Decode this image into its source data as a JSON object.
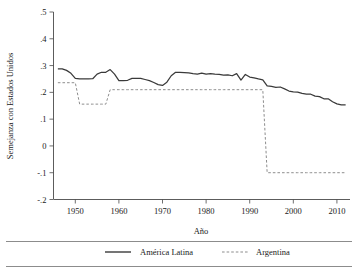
{
  "chart_data": {
    "type": "line",
    "title": "",
    "xlabel": "Año",
    "ylabel": "Semejanza con Estados Unidos",
    "xlim": [
      1945,
      2013
    ],
    "ylim": [
      -0.2,
      0.5
    ],
    "grid": false,
    "legend_position": "bottom",
    "xticks": [
      1950,
      1960,
      1970,
      1980,
      1990,
      2000,
      2010
    ],
    "xtick_labels": [
      "1950",
      "1960",
      "1970",
      "1980",
      "1990",
      "2000",
      "2010"
    ],
    "yticks": [
      0.5,
      0.4,
      0.3,
      0.2,
      0.1,
      0.0,
      -0.1,
      -0.2
    ],
    "ytick_labels": [
      ".5",
      ".4",
      ".3",
      ".2",
      ".1",
      "0",
      "-.1",
      "-.2"
    ],
    "series": [
      {
        "name": "América Latina",
        "style": "solid",
        "color": "#3a3a3a",
        "x": [
          1946,
          1947,
          1948,
          1949,
          1950,
          1951,
          1952,
          1953,
          1954,
          1955,
          1956,
          1957,
          1958,
          1959,
          1960,
          1961,
          1962,
          1963,
          1964,
          1965,
          1966,
          1967,
          1968,
          1969,
          1970,
          1971,
          1972,
          1973,
          1974,
          1975,
          1976,
          1977,
          1978,
          1979,
          1980,
          1981,
          1982,
          1983,
          1984,
          1985,
          1986,
          1987,
          1988,
          1989,
          1990,
          1991,
          1992,
          1993,
          1994,
          1995,
          1996,
          1997,
          1998,
          1999,
          2000,
          2001,
          2002,
          2003,
          2004,
          2005,
          2006,
          2007,
          2008,
          2009,
          2010,
          2011,
          2012
        ],
        "y": [
          0.288,
          0.288,
          0.282,
          0.271,
          0.252,
          0.25,
          0.25,
          0.25,
          0.251,
          0.268,
          0.275,
          0.275,
          0.285,
          0.268,
          0.244,
          0.244,
          0.245,
          0.252,
          0.252,
          0.252,
          0.248,
          0.244,
          0.237,
          0.229,
          0.226,
          0.238,
          0.262,
          0.275,
          0.275,
          0.274,
          0.273,
          0.27,
          0.268,
          0.272,
          0.268,
          0.27,
          0.268,
          0.267,
          0.264,
          0.265,
          0.262,
          0.27,
          0.246,
          0.267,
          0.257,
          0.254,
          0.25,
          0.247,
          0.224,
          0.222,
          0.219,
          0.22,
          0.213,
          0.205,
          0.202,
          0.201,
          0.196,
          0.193,
          0.193,
          0.186,
          0.184,
          0.176,
          0.176,
          0.165,
          0.157,
          0.153,
          0.153
        ]
      },
      {
        "name": "Argentina",
        "style": "dashed",
        "color": "#8d8d8d",
        "x": [
          1946,
          1947,
          1948,
          1949,
          1950,
          1951,
          1952,
          1953,
          1954,
          1955,
          1956,
          1957,
          1958,
          1959,
          1960,
          1961,
          1962,
          1963,
          1964,
          1965,
          1966,
          1967,
          1968,
          1969,
          1970,
          1971,
          1972,
          1973,
          1974,
          1975,
          1976,
          1977,
          1978,
          1979,
          1980,
          1981,
          1982,
          1983,
          1984,
          1985,
          1986,
          1987,
          1988,
          1989,
          1990,
          1991,
          1992,
          1993,
          1994,
          1995,
          1996,
          1997,
          1998,
          1999,
          2000,
          2001,
          2002,
          2003,
          2004,
          2005,
          2006,
          2007,
          2008,
          2009,
          2010,
          2011,
          2012
        ],
        "y": [
          0.236,
          0.236,
          0.236,
          0.236,
          0.236,
          0.156,
          0.156,
          0.156,
          0.156,
          0.156,
          0.156,
          0.156,
          0.21,
          0.21,
          0.21,
          0.21,
          0.21,
          0.21,
          0.21,
          0.21,
          0.21,
          0.21,
          0.21,
          0.21,
          0.21,
          0.21,
          0.21,
          0.21,
          0.21,
          0.21,
          0.21,
          0.21,
          0.21,
          0.21,
          0.21,
          0.21,
          0.21,
          0.21,
          0.21,
          0.21,
          0.21,
          0.21,
          0.21,
          0.21,
          0.21,
          0.21,
          0.21,
          0.21,
          -0.1,
          -0.1,
          -0.1,
          -0.1,
          -0.1,
          -0.1,
          -0.1,
          -0.1,
          -0.1,
          -0.1,
          -0.1,
          -0.1,
          -0.1,
          -0.1,
          -0.1,
          -0.1,
          -0.1,
          -0.1,
          -0.1
        ]
      }
    ],
    "legend": [
      {
        "label": "América Latina",
        "style": "solid"
      },
      {
        "label": "Argentina",
        "style": "dashed"
      }
    ]
  }
}
